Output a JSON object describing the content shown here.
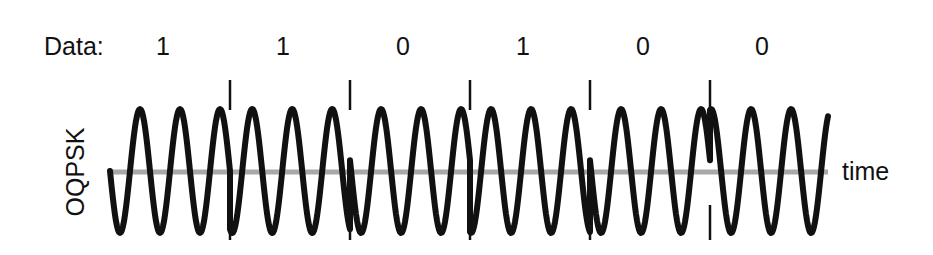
{
  "diagram": {
    "data_label": "Data:",
    "bits": [
      "1",
      "1",
      "0",
      "1",
      "0",
      "0"
    ],
    "bit_centers_x": [
      163,
      283,
      403,
      523,
      643,
      762
    ],
    "y_axis_label": "OQPSK",
    "x_axis_label": "time",
    "colors": {
      "waveform": "#111111",
      "baseline": "#a8a8a8",
      "tick": "#111111",
      "text": "#111111"
    },
    "geometry": {
      "x_start": 110,
      "x_end": 828,
      "center_y": 171,
      "amplitude": 62,
      "period_px": 40,
      "segment_width_px": 120,
      "boundaries_x": [
        230,
        350,
        470,
        590,
        710
      ],
      "segment_phase_deg": [
        180,
        250,
        170,
        260,
        170,
        80
      ],
      "tick_top": [
        80,
        110
      ],
      "tick_bottom": [
        205,
        240
      ]
    }
  }
}
